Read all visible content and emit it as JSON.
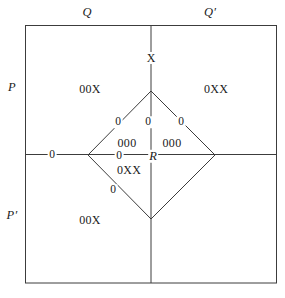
{
  "figure": {
    "type": "region-diagram",
    "background_color": "#ffffff",
    "line_color": "#3c3c3c",
    "text_color": "#1a1a1a",
    "width": 285,
    "height": 298
  },
  "axes": {
    "quadrant_labels": [
      {
        "id": "q",
        "text": "Q",
        "x": 87,
        "y": 12
      },
      {
        "id": "q-prime",
        "text": "Q′",
        "x": 210,
        "y": 12
      },
      {
        "id": "p",
        "text": "P",
        "x": 12,
        "y": 87
      },
      {
        "id": "p-prime",
        "text": "P′",
        "x": 12,
        "y": 215
      }
    ],
    "vertical_axis_x": 151,
    "horizontal_axis_y": 154,
    "box": {
      "left": 25,
      "top": 25,
      "right": 277,
      "bottom": 283
    }
  },
  "diamond": {
    "vertices": {
      "top": {
        "x": 151,
        "y": 91
      },
      "left": {
        "x": 88,
        "y": 155
      },
      "right": {
        "x": 215,
        "y": 155
      },
      "bottom": {
        "x": 151,
        "y": 219
      }
    }
  },
  "labels": {
    "top_axis_marker": {
      "text": "X",
      "x": 151,
      "y": 58
    },
    "center_point": {
      "text": "R",
      "x": 153,
      "y": 156
    },
    "regions": [
      {
        "id": "upper-left",
        "text": "00X",
        "x": 90,
        "y": 89
      },
      {
        "id": "upper-right",
        "text": "0XX",
        "x": 216,
        "y": 89
      },
      {
        "id": "lower-left",
        "text": "00X",
        "x": 90,
        "y": 220
      },
      {
        "id": "inner-upper-left",
        "text": "000",
        "x": 127,
        "y": 143
      },
      {
        "id": "inner-upper-right",
        "text": "000",
        "x": 172,
        "y": 143
      },
      {
        "id": "inner-lower-left",
        "text": "0XX",
        "x": 129,
        "y": 170
      }
    ],
    "zeros": [
      {
        "id": "zero-upper-left-edge",
        "text": "0",
        "x": 118,
        "y": 122
      },
      {
        "id": "zero-upper-center-axis",
        "text": "0",
        "x": 148,
        "y": 122
      },
      {
        "id": "zero-upper-right-edge",
        "text": "0",
        "x": 181,
        "y": 122
      },
      {
        "id": "zero-left-outer-axis",
        "text": "0",
        "x": 52,
        "y": 155
      },
      {
        "id": "zero-left-inner-axis",
        "text": "0",
        "x": 119,
        "y": 156
      },
      {
        "id": "zero-lower-left-edge",
        "text": "0",
        "x": 113,
        "y": 190
      }
    ]
  }
}
